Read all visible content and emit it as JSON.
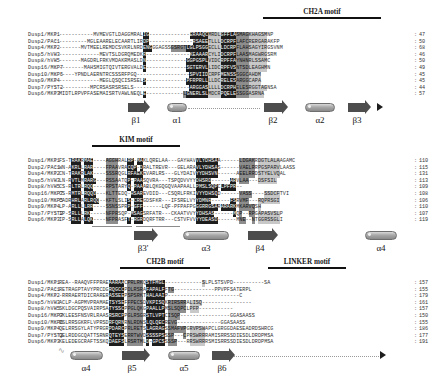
{
  "figure": {
    "type": "multiple-sequence-alignment"
  },
  "sequence_names": [
    "Dusp1/MKP1",
    "Dusp2/PAC1",
    "Dusp4/MKP2",
    "Dusp5/hVH3",
    "Dusp8/hVH5",
    "Dusp16/MKP7",
    "Dusp10/MKP5",
    "Dusp9/MKP4",
    "Dusp7/PYST2",
    "Dusp6/MKP3"
  ],
  "separator": ":",
  "blocks": [
    {
      "id": "block-1",
      "motifs": [
        {
          "label": "CH2A motif",
          "left": 263,
          "width": 118
        }
      ],
      "rows": [
        {
          "name": "Dusp1/MKP1",
          "sequence": "-----------MVMEVGTLDAGGMRALIG-------------ERAAQCMRDLGFFLASMAGKHAGSMNP",
          "end": "47"
        },
        {
          "name": "Dusp2/PAC1",
          "sequence": "---------MGLEAARELECAARTLIRDP--------------RSAEETLLLDCRPFLAFCRERGARAKFP",
          "end": "50"
        },
        {
          "name": "Dusp4/MKP2",
          "sequence": "-------MVTMEELREMDCSVKRLNRDENGGGAGSSGSRGTLGLPSGGECLLLDCRPFLAHSAGYIRGSVNM",
          "end": "68"
        },
        {
          "name": "Dusp5/hVH3",
          "sequence": "-------------MEVTSLDGRQMEDKR--------------KEAAARCYLIDCRPFLAASMAGWRGSRM",
          "end": "46"
        },
        {
          "name": "Dusp8/hVH5",
          "sequence": "-------MAGDRLFRKVMDAKRMASLDN-------------GGPGSPLVIDCRPFFAYNHNRLSSAMC",
          "end": "50"
        },
        {
          "name": "Dusp16/MKP7",
          "sequence": "--------MAHSMIGTQIVTERGVALDE-------------SGTERVLLIDCRPFVSNTSDLEAGHMN",
          "end": "49"
        },
        {
          "name": "Dusp10/MKP5",
          "sequence": "-----YPNDLAERNTRCSSSRFPGQ-----------------SPVIIDCRPFMENSSSGGCAHDM",
          "end": "45"
        },
        {
          "name": "Dusp9/MKP4",
          "sequence": "-------------MEGLQSQCISRSELS-------------PFRPRLLLLDCRELESARGGCAPA",
          "end": "45"
        },
        {
          "name": "Dusp7/PYST2",
          "sequence": "----------MPCRSASRSRSELS------------------ARGGASLLLLDCRPHELESRGGTAGNSA",
          "end": "44"
        },
        {
          "name": "Dusp6/MKP3",
          "sequence": "MIDTLRPVPFASEMAISRTVAWLNEQLE------------LGNERLSLMDCRPQELESSGGASRNA",
          "end": "57"
        }
      ],
      "structures": [
        {
          "kind": "arrow",
          "label": "β1",
          "left": 128,
          "width": 18
        },
        {
          "kind": "helix",
          "label": "α1",
          "left": 167,
          "width": 20
        },
        {
          "kind": "dotline",
          "label": "",
          "left": 188,
          "width": 70
        },
        {
          "kind": "arrow",
          "label": "β2",
          "left": 264,
          "width": 20
        },
        {
          "kind": "helix",
          "label": "α2",
          "left": 305,
          "width": 30
        },
        {
          "kind": "arrow",
          "label": "β3",
          "left": 348,
          "width": 19
        },
        {
          "kind": "tip",
          "label": "",
          "left": 375,
          "width": 6
        }
      ]
    },
    {
      "id": "block-2",
      "motifs": [
        {
          "label": "KIM motif",
          "left": 92,
          "width": 88
        }
      ],
      "rows": [
        {
          "name": "Dusp1/MKP1",
          "sequence": "FS-TRAKRMAE----AGGHRALRP-MAKLQRELAA---GAYHAVVLYDHSAA------LDGAKRDGTLALAAGAMC",
          "end": "110"
        },
        {
          "name": "Dusp2/PAC1",
          "sequence": "WN-AKRLLRAR----FPAAVRACQP-DRALTREVR---GELARAVLYDHSAS------VAELRRPGSPARVLAASS",
          "end": "115"
        },
        {
          "name": "Dusp4/MKP2",
          "sequence": "CN-TRAKRLAK----SSSRQGLRFAEKEVARLRS---GLYDAIVYYDHSVN------AEELRRDSTYELVQAL",
          "end": "131"
        },
        {
          "name": "Dusp5/hVH3",
          "sequence": "LN-RVTLMRARG---RSSAATQP-PAASQVRA---TSPQDVVYYDHSRD------ARVLAA---DSFSIL",
          "end": "113"
        },
        {
          "name": "Dusp8/hVH5",
          "sequence": "CS-RLTRLRQQ----RPSTARYQ-PAAABLQKGQGQVAAPAALLPMSLSQPCLPFPR--",
          "end": "109"
        },
        {
          "name": "Dusp16/MKP7",
          "sequence": "CS-RMTRLRQQD---KLTTEDQ-HSAREVDID---CSQRLFRKIVYYDHSQD------VASS----SSDCFTVI",
          "end": "108"
        },
        {
          "name": "Dusp10/MKP5",
          "sequence": "CADRHRLARLRQQ--KFTLSLIS-CREGDSFKR---IFSRELVYYDMNR------FSRVMF---RQPRSGI",
          "end": "106"
        },
        {
          "name": "Dusp9/MKP4",
          "sequence": "LP-ARLLLLRR----SSNSSPRP-GFF------LQF-PFPAFPGGGRRGSARARARKMKARVQSH",
          "end": "110"
        },
        {
          "name": "Dusp7/PYST2",
          "sequence": "IP-SRLLLRK-----NFPRSQP-MSAGSRFATR---CKAATVVYYDHSAS------MQP--RPGAPASVSLP",
          "end": "107"
        },
        {
          "name": "Dusp6/MKP3",
          "sequence": "IP-SRLLALQK----NFPRASFT-RGRDQRFTRR---CSTVFVVYYDEASD------MNE--NTGGRSSGLI",
          "end": "119"
        }
      ],
      "structures": [
        {
          "kind": "underline",
          "label": "",
          "left": 92,
          "width": 40
        },
        {
          "kind": "underline",
          "label": "",
          "left": 136,
          "width": 44
        },
        {
          "kind": "arrow",
          "label": "β3'",
          "left": 134,
          "width": 20
        },
        {
          "kind": "helix",
          "label": "α3",
          "left": 183,
          "width": 46
        },
        {
          "kind": "arrow",
          "label": "β4",
          "left": 248,
          "width": 26
        },
        {
          "kind": "helix",
          "label": "α4",
          "left": 365,
          "width": 32
        }
      ]
    },
    {
      "id": "block-3",
      "motifs": [
        {
          "label": "CH2B motif",
          "left": 120,
          "width": 90
        },
        {
          "label": "LINKER motif",
          "left": 268,
          "width": 78
        }
      ],
      "rows": [
        {
          "name": "Dusp1/MKP1",
          "sequence": "REA--RAAQVFFPRAEAARAACPRLRKQSTFMGL------------SLPLSTSVPD----------SA",
          "end": "157"
        },
        {
          "name": "Dusp2/PAC1",
          "sequence": "RETRAGPTAVYPRCDGRQGCCPDLRSRAFAPALFFTG-------------PPVPFSATERPL",
          "end": "155"
        },
        {
          "name": "Dusp4/MKP2",
          "sequence": "-RRRAERTDICRARERASSEEPSPSRKTHALAAIP-----------------------C",
          "end": "179"
        },
        {
          "name": "Dusp5/hVH3",
          "sequence": "ACLP-AGPMVPRAMAETSYSEFFPECSDVKPISQKRIRSRRALISQ----------------",
          "end": "161"
        },
        {
          "name": "Dusp8/hVH5",
          "sequence": "SKLDGCPQSVAIRPSATYSSCPPGLQKGPAALLPMSLSQPCLPFP-----------",
          "end": "157"
        },
        {
          "name": "Dusp16/MKP7",
          "sequence": "GKLEESFNSVRLRAASRSRCPPGLRSGRSTLVPTCISQP----------------GGASAASS",
          "end": "150"
        },
        {
          "name": "Dusp10/MKP5",
          "sequence": "ESLRRSGKRFLVPRSDRFQRNRNLRDNSLQLQECREVG--------------GGASAASS",
          "end": "155"
        },
        {
          "name": "Dusp9/MKP4",
          "sequence": "QELRRSGYLATYPRGRPDARCPRLRETSLAGRAGSSMAFVPGRVPSWAPCLGRGGDAESEADRDSHRCG",
          "end": "186"
        },
        {
          "name": "Dusp7/PYST2",
          "sequence": "QELRDDGCQATTSRNRQTEYSERRTWVDSSSSPSSSP---CPRSWRRRAMISRRSSDIESDLDRDPMSA",
          "end": "177"
        },
        {
          "name": "Dusp6/MKP3",
          "sequence": "KELEDEGCRAFTSSKQDAEFSLRSRTMLD-GPCSSSSP---RRSWRRRSMISRRSSDIESDLDRDPMSA",
          "end": "191"
        }
      ],
      "structures": [
        {
          "kind": "coil",
          "label": "",
          "left": 60,
          "width": 8
        },
        {
          "kind": "helix",
          "label": "α4",
          "left": 70,
          "width": 33
        },
        {
          "kind": "arrow",
          "label": "β5",
          "left": 122,
          "width": 24
        },
        {
          "kind": "helix",
          "label": "α5",
          "left": 168,
          "width": 32
        },
        {
          "kind": "arrow",
          "label": "β6",
          "left": 212,
          "width": 19
        },
        {
          "kind": "dotline",
          "label": "",
          "left": 234,
          "width": 145
        },
        {
          "kind": "tip",
          "label": "",
          "left": 378,
          "width": 7
        }
      ]
    }
  ],
  "colors": {
    "background": "#ffffff",
    "text": "#242424",
    "motif_bar": "#111111",
    "conserved_dark": "#1d1d1d",
    "conserved_mid": "#8d8d8d",
    "conserved_light": "#c8c8c8",
    "arrow": "#4d4d4d",
    "helix": "#a8a8a8"
  }
}
